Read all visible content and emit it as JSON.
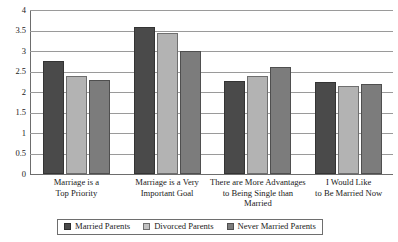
{
  "chart_data": {
    "type": "bar",
    "title": "",
    "subtitle": "",
    "xlabel": "",
    "ylabel": "",
    "ylim": [
      0,
      4
    ],
    "ytick_labels": [
      "4",
      "3.5",
      "3",
      "2.5",
      "2",
      "1.5",
      "1",
      "0.5",
      "0"
    ],
    "ytick_values": [
      4,
      3.5,
      3,
      2.5,
      2,
      1.5,
      1,
      0.5,
      0
    ],
    "grid": true,
    "legend_position": "bottom",
    "categories": [
      "Marriage is a Top Priority",
      "Marriage is a Very Important Goal",
      "There are More Advantages to Being Single than Married",
      "I Would Like to Be Married Now"
    ],
    "category_lines": [
      [
        "Marriage is a",
        "Top Priority"
      ],
      [
        "Marriage is a Very",
        "Important Goal"
      ],
      [
        "There are More Advantages",
        "to Being Single than",
        "Married"
      ],
      [
        "I Would Like",
        "to Be Married Now"
      ]
    ],
    "series": [
      {
        "name": "Married Parents",
        "color": "#4a4a4a",
        "values": [
          2.75,
          3.58,
          2.27,
          2.25
        ]
      },
      {
        "name": "Divorced Parents",
        "color": "#b3b3b3",
        "values": [
          2.38,
          3.43,
          2.38,
          2.15
        ]
      },
      {
        "name": "Never Married Parents",
        "color": "#7c7c7c",
        "values": [
          2.3,
          3.0,
          2.6,
          2.2
        ]
      }
    ]
  },
  "legend": {
    "items": [
      {
        "label": "Married Parents"
      },
      {
        "label": "Divorced Parents"
      },
      {
        "label": "Never Married Parents"
      }
    ]
  },
  "colors": {
    "series_married": "#4a4a4a",
    "series_divorced": "#b3b3b3",
    "series_never_married": "#7c7c7c",
    "gridline": "#9a9a9a",
    "axis": "#6d6d6d",
    "text": "#1a1a1a",
    "background": "#ffffff"
  }
}
